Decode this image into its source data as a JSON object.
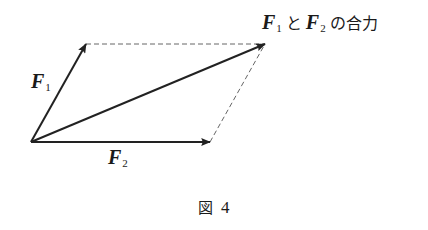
{
  "diagram": {
    "type": "parallelogram-of-forces",
    "vectors": {
      "f1": {
        "label_main": "F",
        "label_sub": "1"
      },
      "f2": {
        "label_main": "F",
        "label_sub": "2"
      },
      "resultant": {
        "label_f1_main": "F",
        "label_f1_sub": "1",
        "connector": "と",
        "label_f2_main": "F",
        "label_f2_sub": "2",
        "suffix": "の合力"
      }
    },
    "colors": {
      "vector": "#222222",
      "dashed": "#666666",
      "background": "#ffffff"
    }
  },
  "caption": {
    "prefix": "図",
    "number": "4"
  }
}
